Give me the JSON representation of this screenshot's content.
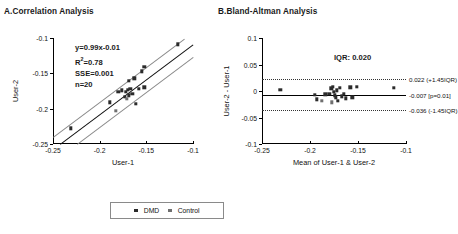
{
  "figure": {
    "panels": [
      {
        "id": "A",
        "title": "A.Correlation Analysis",
        "xlabel": "User-1",
        "ylabel": "User-2"
      },
      {
        "id": "B",
        "title": "B.Bland-Altman Analysis",
        "xlabel": "Mean of User-1 & User-2",
        "ylabel": "User-2 - User-1"
      }
    ]
  },
  "stats": {
    "equation": "y=0.99x-0.01",
    "r2_prefix": "R",
    "r2_sup": "2",
    "r2_value": "=0.78",
    "sse": "SSE=0.001",
    "n": "n=20"
  },
  "bland_altman": {
    "iqr_label": "IQR: 0.020",
    "upper_label": "0.022 (+1.45IQR)",
    "mean_label": "-0.007 [p=0.01]",
    "lower_label": "-0.036 (-1.45IQR)",
    "upper_value": 0.022,
    "mean_value": -0.007,
    "lower_value": -0.036
  },
  "legend": {
    "items": [
      {
        "label": "DMD",
        "color": "#2b2b2b"
      },
      {
        "label": "Control",
        "color": "#6f6f6f"
      }
    ]
  },
  "chart_data": [
    {
      "type": "scatter",
      "panel": "A",
      "title": "A.Correlation Analysis",
      "xlabel": "User-1",
      "ylabel": "User-2",
      "xlim": [
        -0.25,
        -0.1
      ],
      "ylim": [
        -0.25,
        -0.1
      ],
      "xticks": [
        -0.25,
        -0.2,
        -0.15,
        -0.1
      ],
      "yticks": [
        -0.25,
        -0.2,
        -0.15,
        -0.1
      ],
      "xticklabels": [
        "-0.25",
        "-0.2",
        "-0.15",
        "-0.1"
      ],
      "yticklabels": [
        "-0.25",
        "-0.2",
        "-0.15",
        "-0.1"
      ],
      "grid": false,
      "annotations": [
        "y=0.99x-0.01",
        "R2=0.78",
        "SSE=0.001",
        "n=20"
      ],
      "fit": {
        "slope": 0.99,
        "intercept": -0.01,
        "r2": 0.78,
        "sse": 0.001,
        "n": 20
      },
      "confidence_band_offset": 0.018,
      "series": [
        {
          "name": "DMD",
          "color": "#2b2b2b",
          "points": [
            [
              -0.116,
              -0.109
            ],
            [
              -0.152,
              -0.141
            ],
            [
              -0.155,
              -0.147
            ],
            [
              -0.163,
              -0.157
            ],
            [
              -0.169,
              -0.161
            ],
            [
              -0.152,
              -0.17
            ],
            [
              -0.158,
              -0.172
            ],
            [
              -0.167,
              -0.172
            ],
            [
              -0.17,
              -0.173
            ],
            [
              -0.172,
              -0.176
            ],
            [
              -0.176,
              -0.174
            ],
            [
              -0.18,
              -0.176
            ],
            [
              -0.165,
              -0.179
            ],
            [
              -0.169,
              -0.181
            ],
            [
              -0.173,
              -0.183
            ],
            [
              -0.161,
              -0.193
            ],
            [
              -0.189,
              -0.191
            ],
            [
              -0.231,
              -0.228
            ]
          ]
        },
        {
          "name": "Control",
          "color": "#6f6f6f",
          "points": [
            [
              -0.171,
              -0.186
            ],
            [
              -0.183,
              -0.203
            ]
          ]
        }
      ]
    },
    {
      "type": "scatter",
      "panel": "B",
      "title": "B.Bland-Altman Analysis",
      "xlabel": "Mean of User-1 & User-2",
      "ylabel": "User-2 - User-1",
      "xlim": [
        -0.25,
        -0.1
      ],
      "ylim": [
        -0.1,
        0.1
      ],
      "xticks": [
        -0.25,
        -0.2,
        -0.15,
        -0.1
      ],
      "yticks": [
        -0.1,
        -0.05,
        0,
        0.05,
        0.1
      ],
      "xticklabels": [
        "-0.25",
        "-0.2",
        "-0.15",
        "-0.1"
      ],
      "yticklabels": [
        "-0.1",
        "-0.05",
        "0",
        "0.05",
        "0.1"
      ],
      "grid": false,
      "reference_lines": [
        {
          "value": 0.022,
          "style": "dotted",
          "label": "0.022 (+1.45IQR)"
        },
        {
          "value": -0.007,
          "style": "solid",
          "label": "-0.007 [p=0.01]"
        },
        {
          "value": -0.036,
          "style": "dotted",
          "label": "-0.036 (-1.45IQR)"
        }
      ],
      "annotations": [
        "IQR: 0.020"
      ],
      "series": [
        {
          "name": "DMD",
          "color": "#2b2b2b",
          "points": [
            [
              -0.231,
              0.002
            ],
            [
              -0.195,
              -0.007
            ],
            [
              -0.193,
              -0.016
            ],
            [
              -0.184,
              -0.006
            ],
            [
              -0.18,
              -0.005
            ],
            [
              -0.178,
              0.005
            ],
            [
              -0.176,
              0.008
            ],
            [
              -0.175,
              -0.002
            ],
            [
              -0.174,
              -0.008
            ],
            [
              -0.173,
              -0.012
            ],
            [
              -0.172,
              0.001
            ],
            [
              -0.171,
              -0.019
            ],
            [
              -0.169,
              0.006
            ],
            [
              -0.167,
              -0.01
            ],
            [
              -0.165,
              -0.005
            ],
            [
              -0.163,
              -0.014
            ],
            [
              -0.158,
              0.007
            ],
            [
              -0.156,
              -0.012
            ],
            [
              -0.151,
              0.008
            ],
            [
              -0.113,
              0.006
            ]
          ]
        },
        {
          "name": "Control",
          "color": "#6f6f6f",
          "points": [
            [
              -0.188,
              -0.018
            ],
            [
              -0.177,
              -0.021
            ]
          ]
        }
      ]
    }
  ]
}
